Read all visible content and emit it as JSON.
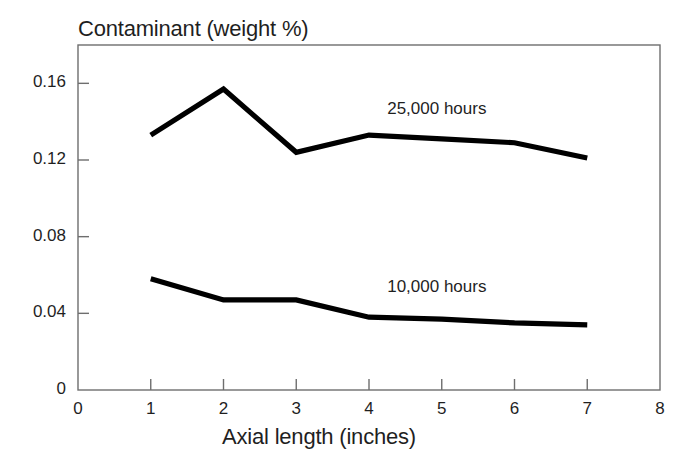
{
  "chart_data": {
    "type": "line",
    "title": "Contaminant (weight %)",
    "xlabel": "Axial length (inches)",
    "ylabel": "Contaminant (weight %)",
    "x": [
      1,
      2,
      3,
      4,
      5,
      6,
      7
    ],
    "xlim": [
      0,
      8
    ],
    "ylim": [
      0,
      0.18
    ],
    "xticks": [
      "0",
      "1",
      "2",
      "3",
      "4",
      "5",
      "6",
      "7",
      "8"
    ],
    "xtick_values": [
      0,
      1,
      2,
      3,
      4,
      5,
      6,
      7,
      8
    ],
    "yticks": [
      "0",
      "0.04",
      "0.08",
      "0.12",
      "0.16"
    ],
    "ytick_values": [
      0,
      0.04,
      0.08,
      0.12,
      0.16
    ],
    "grid": false,
    "legend_position": "inline-annotation",
    "series": [
      {
        "name": "25,000 hours",
        "values": [
          0.133,
          0.157,
          0.124,
          0.133,
          0.131,
          0.129,
          0.121
        ],
        "color": "#000000",
        "label_x": 4.25,
        "label_y": 0.146
      },
      {
        "name": "10,000 hours",
        "values": [
          0.058,
          0.047,
          0.047,
          0.038,
          0.037,
          0.035,
          0.034
        ],
        "color": "#000000",
        "label_x": 4.25,
        "label_y": 0.053
      }
    ],
    "annotations": [
      {
        "text": "25,000 hours",
        "x": 4.25,
        "y": 0.146
      },
      {
        "text": "10,000 hours",
        "x": 4.25,
        "y": 0.053
      }
    ],
    "axis_color": "#6e6e6e",
    "line_color": "#000000"
  }
}
